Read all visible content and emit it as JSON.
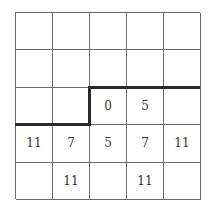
{
  "grid": {
    "rows": 5,
    "cols": 5,
    "cells": [
      [
        "",
        "",
        "",
        "",
        ""
      ],
      [
        "",
        "",
        "",
        "",
        ""
      ],
      [
        "",
        "",
        "0",
        "5",
        ""
      ],
      [
        "11",
        "7",
        "5",
        "7",
        "11"
      ],
      [
        "",
        "11",
        "",
        "11",
        ""
      ]
    ]
  },
  "boundary": {
    "description": "thick staircase line separating region",
    "color": "#2a2a2a"
  }
}
